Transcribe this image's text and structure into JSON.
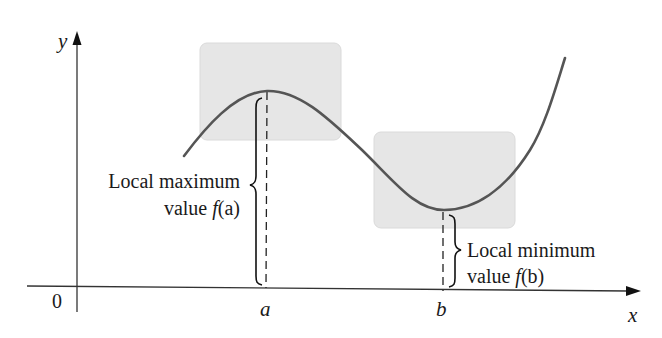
{
  "figure": {
    "axes": {
      "x_label": "x",
      "y_label": "y",
      "origin_label": "0"
    },
    "points": {
      "a_label": "a",
      "b_label": "b"
    },
    "annotations": {
      "max_line1": "Local maximum",
      "max_line2_prefix": "value ",
      "max_line2_func": "f",
      "max_line2_arg": "(a)",
      "min_line1": "Local minimum",
      "min_line2_prefix": "value ",
      "min_line2_func": "f",
      "min_line2_arg": "(b)"
    },
    "colors": {
      "highlight_box": "#e6e6e6",
      "curve": "#555555",
      "axis": "#222222",
      "text": "#1a1a1a"
    }
  }
}
